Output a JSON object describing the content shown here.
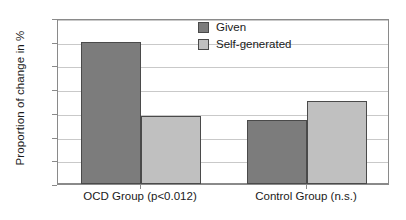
{
  "chart_data": {
    "type": "bar",
    "title": "",
    "xlabel": "",
    "ylabel": "Proportion of change in %",
    "ylim": [
      0,
      14
    ],
    "yticks": [
      "0",
      "2",
      "4",
      "6",
      "8",
      "10",
      "12",
      "14"
    ],
    "grid": true,
    "legend_position": "top-right",
    "categories": [
      "OCD Group (p<0.012)",
      "Control Group (n.s.)"
    ],
    "series": [
      {
        "name": "Given",
        "color": "#7c7c7c",
        "values": [
          12.0,
          5.4
        ]
      },
      {
        "name": "Self-generated",
        "color": "#c0c0c0",
        "values": [
          5.7,
          7.0
        ]
      }
    ]
  },
  "colors": {
    "given": "#7c7c7c",
    "self_generated": "#c0c0c0",
    "axis": "#8a8a8a",
    "gridline": "#c9c9c9",
    "bar_outline": "#4a4a4a",
    "text": "#1a1a1a",
    "background": "#ffffff"
  }
}
